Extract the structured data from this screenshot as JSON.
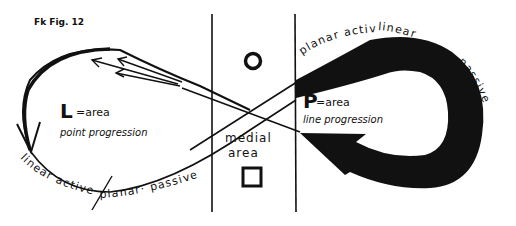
{
  "figure": {
    "title": "Fk Fig. 12",
    "left_region": {
      "letter": "L",
      "equation": "=area",
      "subtitle": "point progression"
    },
    "right_region": {
      "letter": "P",
      "equation": "=area",
      "subtitle": "line progression"
    },
    "center_region": {
      "label_line1": "medial",
      "label_line2": "area",
      "top_symbol": "circle",
      "bottom_symbol": "square"
    },
    "bottom_left_curve_text": {
      "part1": "linear active",
      "part2": "planar· passive"
    },
    "top_right_curve_text": {
      "part1": "planar active",
      "part2": "linear",
      "part3": "passive"
    },
    "colors": {
      "ink": "#111111",
      "paper": "#ffffff"
    }
  }
}
